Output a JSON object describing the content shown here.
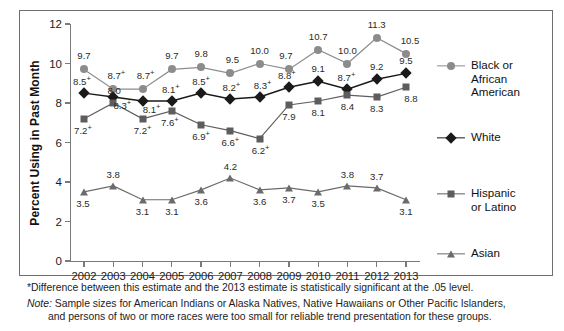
{
  "chart_data": {
    "type": "line",
    "title": "",
    "xlabel": "",
    "ylabel": "Percent Using in Past Month",
    "categories": [
      "2002",
      "2003",
      "2004",
      "2005",
      "2006",
      "2007",
      "2008",
      "2009",
      "2010",
      "2011",
      "2012",
      "2013"
    ],
    "ylim": [
      0,
      12
    ],
    "yticks": [
      0,
      2,
      4,
      6,
      8,
      10,
      12
    ],
    "ytick_labels": [
      "0",
      "2",
      "4",
      "6",
      "8",
      "10",
      "12"
    ],
    "grid": false,
    "legend_position": "right",
    "series": [
      {
        "name": "Black or African American",
        "marker": "circle",
        "color": "#8c8c8c",
        "values": [
          9.7,
          8.7,
          8.7,
          9.7,
          9.8,
          9.5,
          10.0,
          9.7,
          10.7,
          10.0,
          11.3,
          10.5
        ],
        "labels": [
          "9.7",
          "8.7",
          "8.7",
          "9.7",
          "9.8",
          "9.5",
          "10.0",
          "9.7",
          "10.7",
          "10.0",
          "11.3",
          "10.5"
        ],
        "significance": [
          "",
          "+",
          "+",
          "",
          "",
          "",
          "",
          "",
          "",
          "",
          "",
          ""
        ]
      },
      {
        "name": "White",
        "marker": "diamond",
        "color": "#1a1a1a",
        "values": [
          8.5,
          8.3,
          8.1,
          8.1,
          8.5,
          8.2,
          8.3,
          8.8,
          9.1,
          8.7,
          9.2,
          9.5
        ],
        "labels": [
          "8.5",
          "8.3",
          "8.1",
          "8.1",
          "8.5",
          "8.2",
          "8.3",
          "8.8",
          "9.1",
          "8.7",
          "9.2",
          "9.5"
        ],
        "significance": [
          "+",
          "+",
          "+",
          "+",
          "+",
          "+",
          "+",
          "+",
          "",
          "+",
          "",
          ""
        ]
      },
      {
        "name": "Hispanic or Latino",
        "marker": "square",
        "color": "#5d5d5d",
        "values": [
          7.2,
          8.0,
          7.2,
          7.6,
          6.9,
          6.6,
          6.2,
          7.9,
          8.1,
          8.4,
          8.3,
          8.8
        ],
        "labels": [
          "7.2",
          "8.0",
          "7.2",
          "7.6",
          "6.9",
          "6.6",
          "6.2",
          "7.9",
          "8.1",
          "8.4",
          "8.3",
          "8.8"
        ],
        "significance": [
          "+",
          "",
          "+",
          "+",
          "+",
          "+",
          "+",
          "",
          "",
          "",
          "",
          ""
        ]
      },
      {
        "name": "Asian",
        "marker": "triangle",
        "color": "#6b6b6b",
        "values": [
          3.5,
          3.8,
          3.1,
          3.1,
          3.6,
          4.2,
          3.6,
          3.7,
          3.5,
          3.8,
          3.7,
          3.1
        ],
        "labels": [
          "3.5",
          "3.8",
          "3.1",
          "3.1",
          "3.6",
          "4.2",
          "3.6",
          "3.7",
          "3.5",
          "3.8",
          "3.7",
          "3.1"
        ],
        "significance": [
          "",
          "",
          "",
          "",
          "",
          "",
          "",
          "",
          "",
          "",
          "",
          ""
        ]
      }
    ]
  },
  "legend": {
    "entries": [
      {
        "label_line1": "Black or African",
        "label_line2": "American"
      },
      {
        "label_line1": "White",
        "label_line2": ""
      },
      {
        "label_line1": "Hispanic",
        "label_line2": "or Latino"
      },
      {
        "label_line1": "Asian",
        "label_line2": ""
      }
    ]
  },
  "footnotes": {
    "star": "*Difference between this estimate and the 2013 estimate is statistically significant at the .05 level.",
    "note_label": "Note:",
    "note_line1": " Sample sizes for American Indians or Alaska Natives, Native Hawaiians or Other Pacific Islanders,",
    "note_line2": "and persons of two or more races were too small for reliable trend presentation for these groups."
  }
}
